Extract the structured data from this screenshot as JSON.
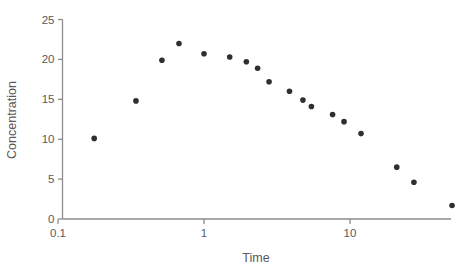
{
  "chart_data": {
    "type": "scatter",
    "title": "",
    "xlabel": "Time",
    "ylabel": "Concentration",
    "xscale": "log",
    "yscale": "linear",
    "xlim": [
      0.1,
      60
    ],
    "ylim": [
      0,
      25
    ],
    "grid": false,
    "legend": null,
    "legend_position": "none",
    "marker": {
      "shape": "circle",
      "color": "#2f2f2f",
      "size_px": 5.6
    },
    "x_tick_labels": [
      "0.1",
      "1",
      "10"
    ],
    "x_tick_values": [
      0.1,
      1,
      10
    ],
    "y_tick_labels": [
      "0",
      "5",
      "10",
      "15",
      "20",
      "25"
    ],
    "y_tick_values": [
      0,
      5,
      10,
      15,
      20,
      25
    ],
    "axis_color": "#8c8c8c",
    "text_color": "#58595b",
    "background": "#ffffff",
    "series": [
      {
        "name": "Concentration vs Time",
        "x": [
          0.177,
          0.342,
          0.515,
          0.674,
          1.0,
          1.5,
          1.95,
          2.33,
          2.79,
          3.85,
          4.76,
          5.44,
          7.6,
          9.1,
          11.9,
          20.9,
          27.4,
          50.0
        ],
        "y": [
          10.1,
          14.8,
          19.9,
          22.0,
          20.7,
          20.3,
          19.7,
          18.9,
          17.2,
          16.0,
          14.9,
          14.1,
          13.1,
          12.2,
          10.7,
          6.5,
          4.6,
          1.7
        ]
      }
    ],
    "points": [
      {
        "x": 0.177,
        "y": 10.1
      },
      {
        "x": 0.342,
        "y": 14.8
      },
      {
        "x": 0.515,
        "y": 19.9
      },
      {
        "x": 0.674,
        "y": 22.0
      },
      {
        "x": 1.0,
        "y": 20.7
      },
      {
        "x": 1.5,
        "y": 20.3
      },
      {
        "x": 1.95,
        "y": 19.7
      },
      {
        "x": 2.33,
        "y": 18.9
      },
      {
        "x": 2.79,
        "y": 17.2
      },
      {
        "x": 3.85,
        "y": 16.0
      },
      {
        "x": 4.76,
        "y": 14.9
      },
      {
        "x": 5.44,
        "y": 14.1
      },
      {
        "x": 7.6,
        "y": 13.1
      },
      {
        "x": 9.1,
        "y": 12.2
      },
      {
        "x": 11.9,
        "y": 10.7
      },
      {
        "x": 20.9,
        "y": 6.5
      },
      {
        "x": 27.4,
        "y": 4.6
      },
      {
        "x": 50.0,
        "y": 1.7
      }
    ]
  },
  "axes": {
    "x_title": "Time",
    "y_title": "Concentration"
  }
}
